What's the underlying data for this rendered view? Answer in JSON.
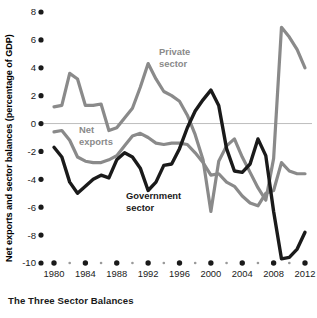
{
  "caption": "The Three Sector Balances",
  "axis": {
    "ylabel": "Net exports and sector balances (percentage of GDP)",
    "xlabel": "Year"
  },
  "labels": {
    "private_line1": "Private",
    "private_line2": "sector",
    "netexports_line1": "Net",
    "netexports_line2": "exports",
    "government_line1": "Government",
    "government_line2": "sector"
  },
  "colors": {
    "dark_series": "#1a1a1a",
    "gray_series": "#8a8a8a",
    "zero_line": "#bdbdbd",
    "background": "#ffffff",
    "text": "#1a1a1a"
  },
  "chart_data": {
    "type": "line",
    "title": "The Three Sector Balances",
    "xlabel": "Year",
    "ylabel": "Net exports and sector balances (percentage of GDP)",
    "xlim": [
      1979,
      2013
    ],
    "ylim": [
      -10,
      8
    ],
    "yticks": [
      -10,
      -8,
      -6,
      -4,
      -2,
      0,
      2,
      4,
      6,
      8
    ],
    "ytick_labels": [
      "-10",
      "-8",
      "-6",
      "-4",
      "-2",
      "0",
      "2",
      "4",
      "6",
      "8"
    ],
    "xticks": [
      1980,
      1984,
      1988,
      1992,
      1996,
      2000,
      2004,
      2008,
      2012
    ],
    "xtick_labels": [
      "1980",
      "1984",
      "1988",
      "1992",
      "1996",
      "2000",
      "2004",
      "2008",
      "2012"
    ],
    "minor_xticks": [
      1982,
      1986,
      1990,
      1994,
      1998,
      2002,
      2006,
      2010
    ],
    "grid": false,
    "legend": "inline-annotations",
    "x": [
      1980,
      1981,
      1982,
      1983,
      1984,
      1985,
      1986,
      1987,
      1988,
      1989,
      1990,
      1991,
      1992,
      1993,
      1994,
      1995,
      1996,
      1997,
      1998,
      1999,
      2000,
      2001,
      2002,
      2003,
      2004,
      2005,
      2006,
      2007,
      2008,
      2009,
      2010,
      2011,
      2012
    ],
    "series": [
      {
        "name": "Private sector",
        "color": "#8a8a8a",
        "values": [
          1.2,
          1.3,
          3.6,
          3.2,
          1.3,
          1.3,
          1.4,
          -0.5,
          -0.3,
          0.4,
          1.1,
          2.6,
          4.3,
          3.2,
          2.3,
          2.0,
          1.6,
          0.6,
          -0.8,
          -2.6,
          -6.3,
          -2.7,
          -1.6,
          -1.1,
          -2.4,
          -3.5,
          -4.6,
          -5.5,
          -2.5,
          6.9,
          6.2,
          5.3,
          4.0
        ]
      },
      {
        "name": "Net exports",
        "color": "#8a8a8a",
        "values": [
          -0.6,
          -0.5,
          -1.2,
          -2.4,
          -2.7,
          -2.8,
          -2.8,
          -2.6,
          -2.3,
          -1.6,
          -0.9,
          -0.7,
          -1.0,
          -1.4,
          -1.5,
          -1.4,
          -1.4,
          -1.5,
          -2.1,
          -2.8,
          -3.7,
          -3.6,
          -4.2,
          -4.5,
          -5.2,
          -5.7,
          -5.9,
          -5.0,
          -4.8,
          -2.8,
          -3.4,
          -3.6,
          -3.6
        ]
      },
      {
        "name": "Government sector",
        "color": "#1a1a1a",
        "values": [
          -1.7,
          -2.4,
          -4.2,
          -5.0,
          -4.5,
          -4.0,
          -3.7,
          -3.9,
          -2.6,
          -2.1,
          -2.4,
          -3.2,
          -4.8,
          -4.2,
          -3.0,
          -2.9,
          -1.8,
          -0.3,
          0.9,
          1.7,
          2.4,
          1.3,
          -1.8,
          -3.4,
          -3.5,
          -2.9,
          -1.1,
          -2.3,
          -6.3,
          -9.7,
          -9.6,
          -9.0,
          -7.8
        ]
      }
    ],
    "annotations": [
      {
        "text": "Private sector",
        "x": 1993,
        "y": 5.5
      },
      {
        "text": "Net exports",
        "x": 1984,
        "y": -0.9
      },
      {
        "text": "Government sector",
        "x": 1990,
        "y": -5.6
      }
    ]
  }
}
